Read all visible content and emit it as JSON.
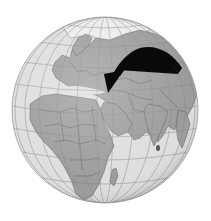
{
  "map": {
    "type": "orthographic-globe",
    "center_region": "Middle East",
    "visible_regions": [
      "Europe",
      "Africa",
      "Middle East",
      "Arabian Peninsula",
      "Russia",
      "Central Asia",
      "India",
      "Sri Lanka",
      "Madagascar",
      "Southeast Asia",
      "Greenland/Arctic"
    ],
    "colors": {
      "ocean": "#dedede",
      "land": "#9c9c9c",
      "borders": "#5a5a5a",
      "graticule": "#8a8a8a",
      "ice": "#ececec",
      "arrow": "#0a0a0a",
      "background": "#ffffff"
    },
    "annotation": {
      "type": "curved-arrow",
      "direction": "from Central Asia toward the eastern Mediterranean / Levant",
      "start": [
        178,
        72
      ],
      "end": [
        108,
        92
      ]
    }
  }
}
